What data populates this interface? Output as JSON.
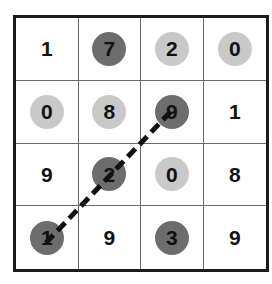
{
  "colors": {
    "dark_chip": "#6d6d6d",
    "light_chip": "#c9c9c9",
    "path_line": "#111111"
  },
  "board": {
    "rows": 4,
    "cols": 4,
    "cells": [
      [
        {
          "value": "1",
          "chip": "none"
        },
        {
          "value": "7",
          "chip": "dark"
        },
        {
          "value": "2",
          "chip": "light"
        },
        {
          "value": "0",
          "chip": "light"
        }
      ],
      [
        {
          "value": "0",
          "chip": "light"
        },
        {
          "value": "8",
          "chip": "light"
        },
        {
          "value": "9",
          "chip": "dark"
        },
        {
          "value": "1",
          "chip": "none"
        }
      ],
      [
        {
          "value": "9",
          "chip": "none"
        },
        {
          "value": "2",
          "chip": "dark"
        },
        {
          "value": "0",
          "chip": "light"
        },
        {
          "value": "8",
          "chip": "none"
        }
      ],
      [
        {
          "value": "1",
          "chip": "dark"
        },
        {
          "value": "9",
          "chip": "none"
        },
        {
          "value": "3",
          "chip": "dark"
        },
        {
          "value": "9",
          "chip": "none"
        }
      ]
    ]
  },
  "path": {
    "style": "dashed",
    "cells": [
      {
        "row": 4,
        "col": 1
      },
      {
        "row": 3,
        "col": 2
      },
      {
        "row": 2,
        "col": 3
      }
    ]
  }
}
